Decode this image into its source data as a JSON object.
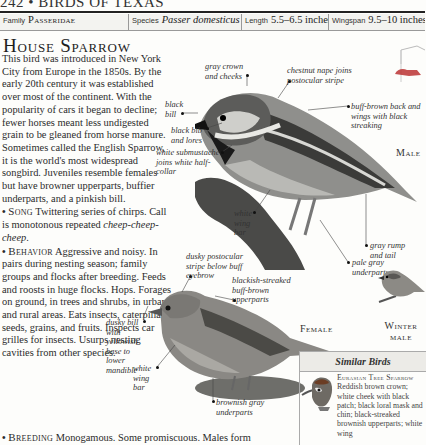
{
  "page_header": "242 • BIRDS OF TEXAS",
  "info_bar": {
    "family_label": "Family",
    "family_value": "Passeridae",
    "species_label": "Species",
    "species_value": "Passer domesticus",
    "length_label": "Length",
    "length_value": "5.5–6.5 inches",
    "wingspan_label": "Wingspan",
    "wingspan_value": "9.5–10 inches"
  },
  "title": "House Sparrow",
  "intro": "This bird was introduced in New York City from Europe in the 1850s. By the early 20th century it was established over most of the continent. With the popularity of cars it began to decline; fewer horses meant less undigested grain to be gleaned from horse manure. Sometimes called the English Sparrow, it is the world's most widespread songbird. Juveniles resemble females but have browner upperparts, buffier underparts, and a pinkish bill.",
  "sections": [
    {
      "heading": "Song",
      "text": "Twittering series of chirps. Call is monotonous repeated ",
      "italic": "cheep-cheep-cheep",
      "after": "."
    },
    {
      "heading": "Behavior",
      "text": "Aggressive and noisy. In pairs during nesting season; family groups and flocks after breeding. Feeds and roosts in huge flocks. Hops. Forages on ground, in trees and shrubs, in urban and rural areas. Eats insects, caterpillars, seeds, grains, and fruits. Inspects car grilles for insects. Usurps nesting cavities from other species."
    },
    {
      "heading": "Breeding",
      "text": "Monogamous. Some promiscuous. Males form"
    }
  ],
  "male_annotations": {
    "gray_crown": "gray crown and cheeks",
    "chestnut_nape": "chestnut nape joins postocular stripe",
    "black_bill": "black bill",
    "black_bib": "black bib and lores",
    "submustache": "white submustache joins white half-collar",
    "buff_back": "buff-brown back and wings with black streaking",
    "white_wing_bar": "white wing bar",
    "gray_rump": "gray rump and tail",
    "pale_gray": "pale gray underparts"
  },
  "female_annotations": {
    "postocular": "dusky postocular stripe below buff eyebrow",
    "upperparts": "blackish-streaked buff-brown upperparts",
    "dusky_bill": "dusky bill with yellowish base to lower mandible",
    "white_wing_bar": "white wing bar",
    "underparts": "brownish gray underparts"
  },
  "labels": {
    "male": "Male",
    "female": "Female",
    "winter_male": "Winter male"
  },
  "similar_birds": {
    "heading": "Similar Birds",
    "items": [
      {
        "name": "Eurasian Tree Sparrow",
        "description": "Reddish brown crown; white cheek with black patch; black loral mask and chin; black-streaked brownish upperparts; white wing"
      }
    ]
  },
  "icons": {
    "habitat": "perching-bird-nest-box-icon"
  }
}
